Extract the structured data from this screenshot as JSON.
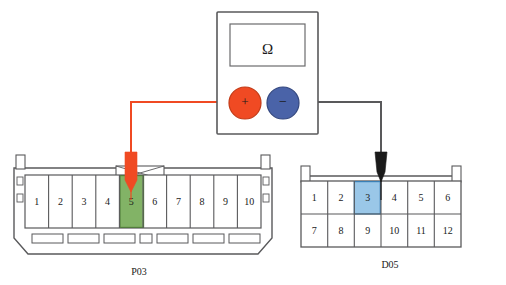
{
  "diagram": {
    "background_color": "#ffffff",
    "outline_color": "#59595b"
  },
  "multimeter": {
    "name": "multimeter",
    "display_symbol": "Ω",
    "body_color": "#ffffff",
    "body_border_color": "#59595b",
    "screen_border_color": "#6b6b6d",
    "terminals": [
      {
        "name": "positive-terminal",
        "symbol": "+",
        "polarity": "positive",
        "color": "#f04a23",
        "border_color": "#c33a16",
        "symbol_color": "#f8b9a4"
      },
      {
        "name": "negative-terminal",
        "symbol": "−",
        "polarity": "negative",
        "color": "#4a63a8",
        "border_color": "#33477f",
        "symbol_color": "#8e9fcb"
      }
    ]
  },
  "leads": [
    {
      "name": "red-test-lead",
      "from": "positive-terminal",
      "to": "P03 pin 5",
      "color": "#f04a23",
      "probe_color": "#f04a23"
    },
    {
      "name": "black-test-lead",
      "from": "negative-terminal",
      "to": "D05 pin 3",
      "color": "#59595b",
      "probe_color": "#1a1a1a"
    }
  ],
  "connectors": [
    {
      "name": "connector-p03",
      "label": "P03",
      "pin_count": 10,
      "rows": 1,
      "pins": [
        {
          "number": "1",
          "highlighted": false
        },
        {
          "number": "2",
          "highlighted": false
        },
        {
          "number": "3",
          "highlighted": false
        },
        {
          "number": "4",
          "highlighted": false
        },
        {
          "number": "5",
          "highlighted": true
        },
        {
          "number": "6",
          "highlighted": false
        },
        {
          "number": "7",
          "highlighted": false
        },
        {
          "number": "8",
          "highlighted": false
        },
        {
          "number": "9",
          "highlighted": false
        },
        {
          "number": "10",
          "highlighted": false
        }
      ],
      "highlight_pin": "5",
      "highlight_color": "#82b366",
      "highlight_border_color": "#4f7a3a",
      "probe": "red-test-lead"
    },
    {
      "name": "connector-d05",
      "label": "D05",
      "pin_count": 12,
      "rows": 2,
      "pins": [
        {
          "number": "1",
          "highlighted": false
        },
        {
          "number": "2",
          "highlighted": false
        },
        {
          "number": "3",
          "highlighted": true
        },
        {
          "number": "4",
          "highlighted": false
        },
        {
          "number": "5",
          "highlighted": false
        },
        {
          "number": "6",
          "highlighted": false
        },
        {
          "number": "7",
          "highlighted": false
        },
        {
          "number": "8",
          "highlighted": false
        },
        {
          "number": "9",
          "highlighted": false
        },
        {
          "number": "10",
          "highlighted": false
        },
        {
          "number": "11",
          "highlighted": false
        },
        {
          "number": "12",
          "highlighted": false
        }
      ],
      "highlight_pin": "3",
      "highlight_color": "#9ac7e8",
      "highlight_border_color": "#3a7fb5",
      "probe": "black-test-lead"
    }
  ]
}
